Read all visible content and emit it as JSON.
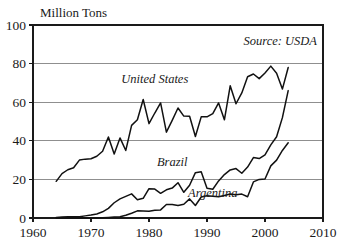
{
  "chart_data": {
    "type": "line",
    "title": "",
    "subtitle": "",
    "ylabel": "Million Tons",
    "xlabel": "",
    "annotation": "Source: USDA",
    "xlim": [
      1960,
      2010
    ],
    "ylim": [
      0,
      100
    ],
    "xticks": [
      1960,
      1970,
      1980,
      1990,
      2000,
      2010
    ],
    "xtick_labels": [
      "1960",
      "1970",
      "1980",
      "1990",
      "2000",
      "2010"
    ],
    "yticks": [
      0,
      20,
      40,
      60,
      80,
      100
    ],
    "ytick_labels": [
      "0",
      "20",
      "40",
      "60",
      "80",
      "100"
    ],
    "gridlines_y": [
      20,
      40,
      60,
      80
    ],
    "grid": true,
    "legend_position": "inline-labels",
    "line_color": "#111111",
    "grid_color": "#8f8f8f",
    "axis_color": "#1a1a1a",
    "series": [
      {
        "name": "United States",
        "label": "United States",
        "label_x": 1981,
        "label_y": 70,
        "x": [
          1964,
          1965,
          1966,
          1967,
          1968,
          1969,
          1970,
          1971,
          1972,
          1973,
          1974,
          1975,
          1976,
          1977,
          1978,
          1979,
          1980,
          1981,
          1982,
          1983,
          1984,
          1985,
          1986,
          1987,
          1988,
          1989,
          1990,
          1991,
          1992,
          1993,
          1994,
          1995,
          1996,
          1997,
          1998,
          1999,
          2000,
          2001,
          2002,
          2003,
          2004
        ],
        "y": [
          19,
          23,
          25,
          26,
          30,
          30.5,
          30.7,
          32,
          34.6,
          42,
          33.2,
          41.5,
          35,
          48,
          50.9,
          61.4,
          48.9,
          54.4,
          59.6,
          44.5,
          50.6,
          57,
          52.8,
          52.7,
          42.2,
          52.4,
          52.4,
          54.1,
          59.6,
          50.9,
          68.5,
          59.2,
          64.8,
          73.2,
          74.6,
          72.2,
          75.1,
          78.7,
          75.0,
          66.8,
          78.0
        ]
      },
      {
        "name": "Brazil",
        "label": "Brazil",
        "label_x": 1984,
        "label_y": 27,
        "x": [
          1964,
          1965,
          1966,
          1967,
          1968,
          1969,
          1970,
          1971,
          1972,
          1973,
          1974,
          1975,
          1976,
          1977,
          1978,
          1979,
          1980,
          1981,
          1982,
          1983,
          1984,
          1985,
          1986,
          1987,
          1988,
          1989,
          1990,
          1991,
          1992,
          1993,
          1994,
          1995,
          1996,
          1997,
          1998,
          1999,
          2000,
          2001,
          2002,
          2003,
          2004
        ],
        "y": [
          0.3,
          0.5,
          0.6,
          0.7,
          0.7,
          1.1,
          1.5,
          2.1,
          3.2,
          5.0,
          7.9,
          9.9,
          11.2,
          12.5,
          9.5,
          10.2,
          15.2,
          15.0,
          12.8,
          14.6,
          15.5,
          18.3,
          13.3,
          17.0,
          23.5,
          24.0,
          15.4,
          14.9,
          19.2,
          22.5,
          24.9,
          25.6,
          23.2,
          26.4,
          31.3,
          30.8,
          32.7,
          37.9,
          42.1,
          52.0,
          66.0
        ]
      },
      {
        "name": "Argentina",
        "label": "Argentina",
        "label_x": 1991,
        "label_y": 11,
        "x": [
          1964,
          1965,
          1966,
          1967,
          1968,
          1969,
          1970,
          1971,
          1972,
          1973,
          1974,
          1975,
          1976,
          1977,
          1978,
          1979,
          1980,
          1981,
          1982,
          1983,
          1984,
          1985,
          1986,
          1987,
          1988,
          1989,
          1990,
          1991,
          1992,
          1993,
          1994,
          1995,
          1996,
          1997,
          1998,
          1999,
          2000,
          2001,
          2002,
          2003,
          2004
        ],
        "y": [
          0.02,
          0.02,
          0.02,
          0.02,
          0.02,
          0.03,
          0.03,
          0.06,
          0.08,
          0.3,
          0.5,
          0.7,
          1.4,
          2.5,
          3.7,
          3.6,
          3.5,
          4.0,
          4.2,
          7.0,
          7.0,
          6.5,
          7.1,
          9.9,
          6.5,
          10.9,
          11.5,
          11.3,
          11.0,
          11.7,
          12.4,
          12.1,
          12.4,
          11.0,
          18.7,
          20.0,
          20.2,
          27.0,
          30.0,
          35.0,
          39.0
        ]
      }
    ]
  }
}
